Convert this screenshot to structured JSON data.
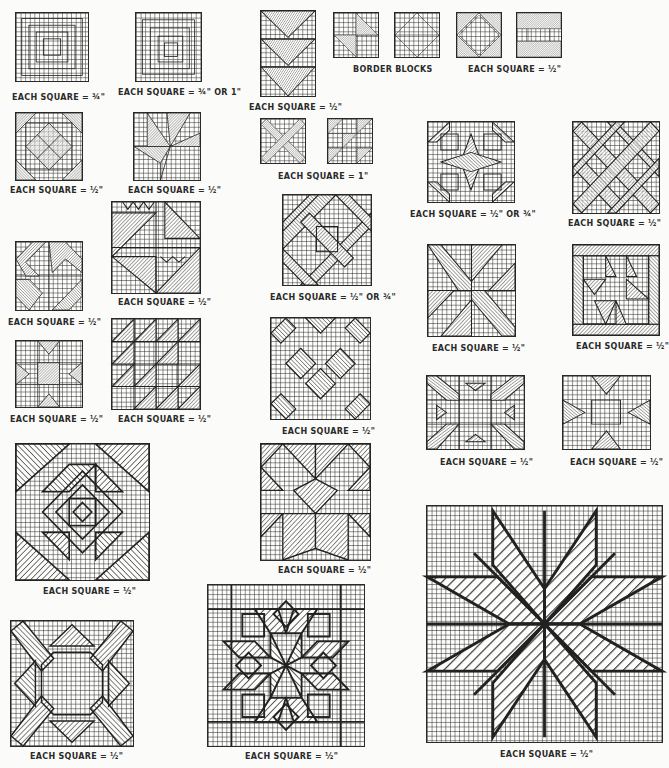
{
  "captions": {
    "c1": "EACH SQUARE = ¾\"",
    "c2": "EACH SQUARE = ¾\" OR 1\"",
    "c3": "EACH SQUARE = ½\"",
    "c4": "BORDER BLOCKS",
    "c5": "EACH SQUARE = ½\"",
    "c6": "EACH SQUARE = ½\"",
    "c7": "EACH SQUARE = ½\"",
    "c8": "EACH SQUARE = 1\"",
    "c9": "EACH SQUARE = ½\" OR ¾\"",
    "c10": "EACH SQUARE = ½\"",
    "c11": "EACH SQUARE = ½\"",
    "c12": "EACH SQUARE = ½\"",
    "c13": "EACH SQUARE = ½\" OR ¾\"",
    "c14": "EACH SQUARE = ½\"",
    "c15": "EACH SQUARE = ½\"",
    "c16": "EACH SQUARE = ½\"",
    "c17": "EACH SQUARE = ½\"",
    "c18": "EACH SQUARE = ½\"",
    "c19": "EACH SQUARE = ½\"",
    "c20": "EACH SQUARE = ½\"",
    "c21": "EACH SQUARE = ½\"",
    "c22": "EACH SQUARE = ½\"",
    "c23": "EACH SQUARE = ½\"",
    "c24": "EACH SQUARE = ½\"",
    "c25": "EACH SQUARE = ½\""
  },
  "blocks": [
    {
      "id": "log-cabin-1",
      "pattern": "concentric squares"
    },
    {
      "id": "log-cabin-2",
      "pattern": "concentric squares offset"
    },
    {
      "id": "flying-geese-column",
      "pattern": "stacked triangles"
    },
    {
      "id": "border-block-1",
      "pattern": "half-square triangles"
    },
    {
      "id": "border-block-2",
      "pattern": "square in square outline"
    },
    {
      "id": "border-block-3",
      "pattern": "square in square hatched corners"
    },
    {
      "id": "border-block-4",
      "pattern": "bars"
    },
    {
      "id": "square-lattice",
      "pattern": "on-point lattice"
    },
    {
      "id": "lily-block",
      "pattern": "lily"
    },
    {
      "id": "x-block",
      "pattern": "crossed bands"
    },
    {
      "id": "triangles-block",
      "pattern": "small triangles"
    },
    {
      "id": "octagon-star",
      "pattern": "eight-point star octagon"
    },
    {
      "id": "diagonal-lattice",
      "pattern": "diagonal lattice"
    },
    {
      "id": "pinwheel",
      "pattern": "pinwheel"
    },
    {
      "id": "cake-stand",
      "pattern": "sawtooth triangles"
    },
    {
      "id": "woven-square",
      "pattern": "woven bands"
    },
    {
      "id": "star-x",
      "pattern": "x star"
    },
    {
      "id": "bordered-stars",
      "pattern": "framed triangles"
    },
    {
      "id": "ohio-star",
      "pattern": "ohio star"
    },
    {
      "id": "diagonal-triangles",
      "pattern": "triangles"
    },
    {
      "id": "lattice-diamond",
      "pattern": "diamond lattice"
    },
    {
      "id": "sawtooth-frame",
      "pattern": "sawtooth frame"
    },
    {
      "id": "eight-point-star",
      "pattern": "star"
    },
    {
      "id": "pineapple",
      "pattern": "pineapple"
    },
    {
      "id": "flying-birds",
      "pattern": "birds"
    },
    {
      "id": "lone-star",
      "pattern": "lone star"
    },
    {
      "id": "octagon-cross",
      "pattern": "octagon cross"
    },
    {
      "id": "carpenters-wheel",
      "pattern": "carpenter's wheel"
    }
  ]
}
